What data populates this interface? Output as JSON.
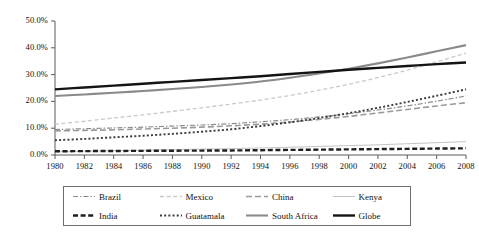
{
  "chart_data": {
    "type": "line",
    "title": "",
    "xlabel": "",
    "ylabel": "",
    "xlim": [
      1980,
      2008
    ],
    "ylim": [
      0,
      50
    ],
    "grid": false,
    "legend_position": "bottom",
    "x": [
      1980,
      1982,
      1984,
      1986,
      1988,
      1990,
      1992,
      1994,
      1996,
      1998,
      2000,
      2002,
      2004,
      2006,
      2008
    ],
    "xtick_labels": [
      "1980",
      "1982",
      "1984",
      "1986",
      "1988",
      "1990",
      "1992",
      "1994",
      "1996",
      "1998",
      "2000",
      "2002",
      "2004",
      "2006",
      "2008"
    ],
    "ytick_labels": [
      "0.0%",
      "10.0%",
      "20.0%",
      "30.0%",
      "40.0%",
      "50.0%"
    ],
    "ytick_values": [
      0,
      10,
      20,
      30,
      40,
      50
    ],
    "series": [
      {
        "name": "Brazil",
        "color": "#8c8c8c",
        "style": "dash-dot",
        "width": 1.2,
        "values": [
          9.5,
          9.8,
          10.1,
          10.4,
          10.8,
          11.2,
          11.7,
          12.4,
          13.2,
          14.2,
          15.4,
          16.8,
          18.3,
          20.1,
          22.0
        ]
      },
      {
        "name": "Mexico",
        "color": "#c9c9c9",
        "style": "dashed",
        "width": 1.3,
        "values": [
          11.5,
          12.6,
          13.8,
          15.0,
          16.3,
          17.6,
          19.0,
          20.5,
          22.2,
          24.2,
          26.4,
          28.9,
          31.7,
          34.8,
          38.0
        ]
      },
      {
        "name": "China",
        "color": "#9a9a9a",
        "style": "dashed-long",
        "width": 1.6,
        "values": [
          9.0,
          9.2,
          9.4,
          9.7,
          10.0,
          10.4,
          10.9,
          11.5,
          12.3,
          13.3,
          14.4,
          15.7,
          17.0,
          18.3,
          19.5
        ]
      },
      {
        "name": "Kenya",
        "color": "#c4c4c4",
        "style": "solid",
        "width": 1.0,
        "values": [
          1.2,
          1.4,
          1.6,
          1.8,
          2.0,
          2.2,
          2.4,
          2.6,
          2.9,
          3.2,
          3.5,
          3.8,
          4.2,
          4.6,
          5.0
        ]
      },
      {
        "name": "India",
        "color": "#1f1f1f",
        "style": "dashed-bold",
        "width": 2.4,
        "values": [
          1.4,
          1.45,
          1.5,
          1.55,
          1.6,
          1.65,
          1.7,
          1.8,
          1.9,
          2.0,
          2.1,
          2.2,
          2.3,
          2.4,
          2.5
        ]
      },
      {
        "name": "Guatamala",
        "color": "#3a3a3a",
        "style": "dotted",
        "width": 1.9,
        "values": [
          5.5,
          6.0,
          6.6,
          7.2,
          7.9,
          8.7,
          9.6,
          10.8,
          12.2,
          13.8,
          15.6,
          17.6,
          19.8,
          22.1,
          24.5
        ]
      },
      {
        "name": "South Africa",
        "color": "#8a8a8a",
        "style": "solid",
        "width": 2.1,
        "values": [
          22.0,
          22.6,
          23.2,
          23.9,
          24.6,
          25.4,
          26.3,
          27.4,
          28.8,
          30.4,
          32.2,
          34.2,
          36.4,
          38.7,
          41.0
        ]
      },
      {
        "name": "Globe",
        "color": "#141414",
        "style": "solid",
        "width": 2.4,
        "values": [
          24.5,
          25.2,
          25.9,
          26.6,
          27.3,
          28.0,
          28.7,
          29.4,
          30.2,
          31.0,
          31.8,
          32.5,
          33.2,
          33.9,
          34.5
        ]
      }
    ]
  },
  "axis": {
    "y_tick_labels": [
      "50.0%",
      "40.0%",
      "30.0%",
      "20.0%",
      "10.0%",
      "0.0%"
    ],
    "x_tick_labels": [
      "1980",
      "1982",
      "1984",
      "1986",
      "1988",
      "1990",
      "1992",
      "1994",
      "1996",
      "1998",
      "2000",
      "2002",
      "2004",
      "2006",
      "2008"
    ]
  },
  "legend": {
    "entries": [
      {
        "label": "Brazil"
      },
      {
        "label": "Mexico"
      },
      {
        "label": "China"
      },
      {
        "label": "Kenya"
      },
      {
        "label": "India"
      },
      {
        "label": "Guatamala"
      },
      {
        "label": "South Africa"
      },
      {
        "label": "Globe"
      }
    ]
  }
}
